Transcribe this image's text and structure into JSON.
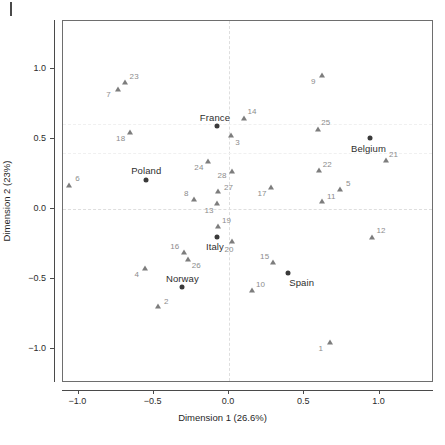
{
  "chart_data": {
    "type": "scatter",
    "title": "",
    "xlabel": "Dimension 1 (26.6%)",
    "ylabel": "Dimension 2 (23%)",
    "xlim": [
      -1.15,
      1.12
    ],
    "ylim": [
      -1.17,
      1.17
    ],
    "xticks": [
      -1.0,
      -0.5,
      0.0,
      0.5,
      1.0
    ],
    "xticklabels": [
      "−1.0",
      "−0.5",
      "0.0",
      "0.5",
      "1.0"
    ],
    "yticks": [
      1.0,
      0.5,
      0.0,
      -0.5,
      -1.0
    ],
    "yticklabels": [
      "1.0",
      "0.5",
      "0.0",
      "−0.5",
      "−1.0"
    ],
    "grid": false,
    "guides": {
      "vertical_at": 0.0,
      "horizontal_at": 0.0,
      "style": "dashed",
      "color": "#dedede"
    },
    "legend": "none",
    "series": [
      {
        "name": "variables",
        "marker": "triangle",
        "color": "#7d7d7d",
        "label_color": "#8c8c8c",
        "points": [
          {
            "label": "1",
            "x": 0.67,
            "y": -0.95,
            "label_dx": -9,
            "label_dy": 6
          },
          {
            "label": "2",
            "x": -0.47,
            "y": -0.69,
            "label_dx": 8,
            "label_dy": -5
          },
          {
            "label": "3",
            "x": 0.01,
            "y": 0.53,
            "label_dx": 7,
            "label_dy": 7
          },
          {
            "label": "4",
            "x": -0.56,
            "y": -0.42,
            "label_dx": -8,
            "label_dy": 6
          },
          {
            "label": "5",
            "x": 0.74,
            "y": 0.14,
            "label_dx": 8,
            "label_dy": -6
          },
          {
            "label": "6",
            "x": -1.06,
            "y": 0.17,
            "label_dx": 8,
            "label_dy": -7
          },
          {
            "label": "7",
            "x": -0.74,
            "y": 0.86,
            "label_dx": -9,
            "label_dy": 5
          },
          {
            "label": "8",
            "x": -0.23,
            "y": 0.07,
            "label_dx": -8,
            "label_dy": -6
          },
          {
            "label": "9",
            "x": 0.62,
            "y": 0.96,
            "label_dx": -9,
            "label_dy": 6
          },
          {
            "label": "10",
            "x": 0.15,
            "y": -0.58,
            "label_dx": 9,
            "label_dy": -6
          },
          {
            "label": "11",
            "x": 0.62,
            "y": 0.06,
            "label_dx": 9,
            "label_dy": -5
          },
          {
            "label": "12",
            "x": 0.95,
            "y": -0.2,
            "label_dx": 9,
            "label_dy": -7
          },
          {
            "label": "13",
            "x": -0.08,
            "y": 0.04,
            "label_dx": -8,
            "label_dy": 7
          },
          {
            "label": "14",
            "x": 0.1,
            "y": 0.65,
            "label_dx": 8,
            "label_dy": -7
          },
          {
            "label": "15",
            "x": 0.29,
            "y": -0.38,
            "label_dx": -8,
            "label_dy": -6
          },
          {
            "label": "16",
            "x": -0.3,
            "y": -0.31,
            "label_dx": -9,
            "label_dy": -6
          },
          {
            "label": "17",
            "x": 0.28,
            "y": 0.16,
            "label_dx": -9,
            "label_dy": 6
          },
          {
            "label": "18",
            "x": -0.66,
            "y": 0.55,
            "label_dx": -9,
            "label_dy": 6
          },
          {
            "label": "19",
            "x": -0.07,
            "y": -0.12,
            "label_dx": 8,
            "label_dy": -6
          },
          {
            "label": "20",
            "x": 0.02,
            "y": -0.23,
            "label_dx": -3,
            "label_dy": 8
          },
          {
            "label": "21",
            "x": 1.04,
            "y": 0.35,
            "label_dx": 8,
            "label_dy": -6
          },
          {
            "label": "22",
            "x": 0.6,
            "y": 0.28,
            "label_dx": 8,
            "label_dy": -6
          },
          {
            "label": "23",
            "x": -0.69,
            "y": 0.91,
            "label_dx": 9,
            "label_dy": -6
          },
          {
            "label": "24",
            "x": -0.14,
            "y": 0.34,
            "label_dx": -9,
            "label_dy": 6
          },
          {
            "label": "25",
            "x": 0.59,
            "y": 0.57,
            "label_dx": 8,
            "label_dy": -7
          },
          {
            "label": "26",
            "x": -0.27,
            "y": -0.36,
            "label_dx": 8,
            "label_dy": 6
          },
          {
            "label": "27",
            "x": -0.07,
            "y": 0.13,
            "label_dx": 10,
            "label_dy": -4
          },
          {
            "label": "28",
            "x": 0.02,
            "y": 0.27,
            "label_dx": -10,
            "label_dy": 4
          }
        ]
      },
      {
        "name": "countries",
        "marker": "dot",
        "color": "#3a3a3a",
        "label_color": "#2e2e2e",
        "points": [
          {
            "label": "France",
            "x": -0.08,
            "y": 0.59,
            "label_dx": -2,
            "label_dy": -9
          },
          {
            "label": "Belgium",
            "x": 0.94,
            "y": 0.51,
            "label_dx": -2,
            "label_dy": 10
          },
          {
            "label": "Poland",
            "x": -0.55,
            "y": 0.21,
            "label_dx": 0,
            "label_dy": -10
          },
          {
            "label": "Italy",
            "x": -0.08,
            "y": -0.2,
            "label_dx": -2,
            "label_dy": 9
          },
          {
            "label": "Norway",
            "x": -0.31,
            "y": -0.56,
            "label_dx": 0,
            "label_dy": -9
          },
          {
            "label": "Spain",
            "x": 0.39,
            "y": -0.46,
            "label_dx": 14,
            "label_dy": 9
          }
        ]
      }
    ]
  }
}
